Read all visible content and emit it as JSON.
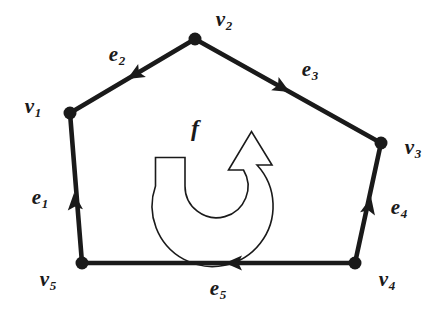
{
  "figure": {
    "kind": "oriented-polygon-face-diagram",
    "width": 443,
    "height": 317,
    "background_color": "#ffffff",
    "ink_color": "#1a1a1a",
    "edge_stroke_width": 4.6,
    "vertex_dot_radius": 6.5,
    "outline_stroke_width": 1.6
  },
  "face": {
    "symbol_base": "f",
    "symbol_sub": "",
    "label_x": 195,
    "label_y": 128,
    "orientation": "counterclockwise",
    "arrow_style": "hollow-outline-curved-arrow"
  },
  "vertices": [
    {
      "id": "v1",
      "base": "v",
      "sub": "1",
      "x": 70,
      "y": 113,
      "label_x": 33,
      "label_y": 107
    },
    {
      "id": "v2",
      "base": "v",
      "sub": "2",
      "x": 195,
      "y": 39,
      "label_x": 224,
      "label_y": 20
    },
    {
      "id": "v3",
      "base": "v",
      "sub": "3",
      "x": 381,
      "y": 143,
      "label_x": 413,
      "label_y": 148
    },
    {
      "id": "v4",
      "base": "v",
      "sub": "4",
      "x": 355,
      "y": 263,
      "label_x": 387,
      "label_y": 280
    },
    {
      "id": "v5",
      "base": "v",
      "sub": "5",
      "x": 82,
      "y": 263,
      "label_x": 48,
      "label_y": 280
    }
  ],
  "edges": [
    {
      "id": "e1",
      "base": "e",
      "sub": "1",
      "from": "v5",
      "to": "v1",
      "x1": 82,
      "y1": 263,
      "x2": 70,
      "y2": 113,
      "arrow_x": 74.8,
      "arrow_y": 203,
      "arrow_angle": -94.6,
      "label_x": 40,
      "label_y": 198
    },
    {
      "id": "e2",
      "base": "e",
      "sub": "2",
      "from": "v2",
      "to": "v1",
      "x1": 195,
      "y1": 39,
      "x2": 70,
      "y2": 113,
      "arrow_x": 136,
      "arrow_y": 74,
      "arrow_angle": 149.4,
      "label_x": 117,
      "label_y": 55
    },
    {
      "id": "e3",
      "base": "e",
      "sub": "3",
      "from": "v2",
      "to": "v3",
      "x1": 195,
      "y1": 39,
      "x2": 381,
      "y2": 143,
      "arrow_x": 281,
      "arrow_y": 87,
      "arrow_angle": 29.2,
      "label_x": 310,
      "label_y": 70
    },
    {
      "id": "e4",
      "base": "e",
      "sub": "4",
      "from": "v4",
      "to": "v3",
      "x1": 355,
      "y1": 263,
      "x2": 381,
      "y2": 143,
      "arrow_x": 369,
      "arrow_y": 207,
      "arrow_angle": -77.8,
      "label_x": 399,
      "label_y": 208
    },
    {
      "id": "e5",
      "base": "e",
      "sub": "5",
      "from": "v4",
      "to": "v5",
      "x1": 355,
      "y1": 263,
      "x2": 82,
      "y2": 263,
      "arrow_x": 235,
      "arrow_y": 263,
      "arrow_angle": 180,
      "label_x": 218,
      "label_y": 289
    }
  ]
}
